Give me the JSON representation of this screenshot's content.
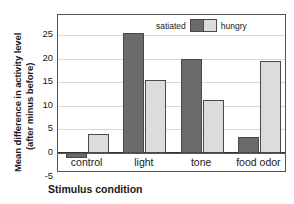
{
  "chart_data": {
    "type": "bar",
    "title": "",
    "xlabel": "Stimulus condition",
    "ylabel_line1": "Mean difference in activity level",
    "ylabel_line2": "(after minus before)",
    "categories": [
      "control",
      "light",
      "tone",
      "food odor"
    ],
    "series": [
      {
        "name": "satiated",
        "color": "#6b6b6b",
        "values": [
          -1,
          25.5,
          20,
          3.3
        ]
      },
      {
        "name": "hungry",
        "color": "#dcdcdc",
        "values": [
          4,
          15.5,
          11.2,
          19.5
        ]
      }
    ],
    "ylim": [
      -5,
      28
    ],
    "yticks": [
      25,
      20,
      15,
      10,
      5,
      0,
      -5
    ],
    "ytick_labels": [
      "25",
      "20",
      "15",
      "10",
      "5",
      "0",
      "-5"
    ],
    "grid": true,
    "legend_position": "top-center"
  },
  "legend": {
    "left_label": "satiated",
    "right_label": "hungry"
  }
}
